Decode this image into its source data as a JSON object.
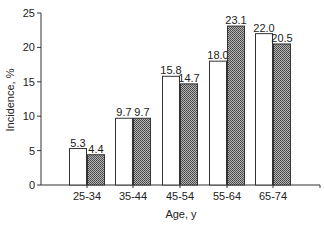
{
  "chart_data": {
    "type": "bar",
    "title": "",
    "xlabel": "Age, y",
    "ylabel": "Incidence, %",
    "ylim": [
      0,
      25
    ],
    "yticks": [
      0,
      5,
      10,
      15,
      20,
      25
    ],
    "grid": false,
    "legend": null,
    "categories": [
      "25-34",
      "35-44",
      "45-54",
      "55-64",
      "65-74"
    ],
    "series": [
      {
        "name": "Series 1 (open bars)",
        "fill": "#ffffff",
        "values": [
          5.3,
          9.7,
          15.8,
          18.0,
          22.0
        ]
      },
      {
        "name": "Series 2 (hatched bars)",
        "fill": "#8a8a8a",
        "values": [
          4.4,
          9.7,
          14.7,
          23.1,
          20.5
        ]
      }
    ],
    "value_labels": [
      [
        "5.3",
        "9.7",
        "15.8",
        "18.0",
        "22.0"
      ],
      [
        "4.4",
        "9.7",
        "14.7",
        "23.1",
        "20.5"
      ]
    ]
  }
}
